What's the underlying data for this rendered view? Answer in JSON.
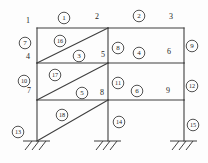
{
  "diagram": {
    "kind": "structural-frame-element-numbering",
    "background": "#fdfdfd",
    "line_color": "#3f3f3f",
    "text_color": "#1e1e1e",
    "circle_fill": "#fdfdfd",
    "nodes": [
      {
        "label": "1",
        "x": 28,
        "y": 21
      },
      {
        "label": "2",
        "x": 97,
        "y": 17
      },
      {
        "label": "3",
        "x": 171,
        "y": 17
      },
      {
        "label": "4",
        "x": 28,
        "y": 57
      },
      {
        "label": "5",
        "x": 103,
        "y": 55
      },
      {
        "label": "6",
        "x": 169,
        "y": 52
      },
      {
        "label": "7",
        "x": 29,
        "y": 91
      },
      {
        "label": "8",
        "x": 102,
        "y": 93
      },
      {
        "label": "9",
        "x": 168,
        "y": 91
      }
    ],
    "members": [
      {
        "id": "1",
        "type": "beam",
        "x1": 37,
        "y1": 28,
        "x2": 108,
        "y2": 28
      },
      {
        "id": "2",
        "type": "beam",
        "x1": 108,
        "y1": 28,
        "x2": 184,
        "y2": 28
      },
      {
        "id": "3",
        "type": "beam",
        "x1": 37,
        "y1": 63,
        "x2": 108,
        "y2": 63
      },
      {
        "id": "4",
        "type": "beam",
        "x1": 108,
        "y1": 63,
        "x2": 184,
        "y2": 63
      },
      {
        "id": "5",
        "type": "beam",
        "x1": 37,
        "y1": 100,
        "x2": 108,
        "y2": 100
      },
      {
        "id": "6",
        "type": "beam",
        "x1": 108,
        "y1": 100,
        "x2": 184,
        "y2": 100
      },
      {
        "id": "7",
        "type": "column",
        "x1": 37,
        "y1": 28,
        "x2": 37,
        "y2": 63
      },
      {
        "id": "8",
        "type": "column",
        "x1": 108,
        "y1": 28,
        "x2": 108,
        "y2": 63
      },
      {
        "id": "9",
        "type": "column",
        "x1": 184,
        "y1": 28,
        "x2": 184,
        "y2": 63
      },
      {
        "id": "10",
        "type": "column",
        "x1": 37,
        "y1": 63,
        "x2": 37,
        "y2": 100
      },
      {
        "id": "11",
        "type": "column",
        "x1": 108,
        "y1": 63,
        "x2": 108,
        "y2": 100
      },
      {
        "id": "12",
        "type": "column",
        "x1": 184,
        "y1": 63,
        "x2": 184,
        "y2": 100
      },
      {
        "id": "13",
        "type": "column",
        "x1": 37,
        "y1": 100,
        "x2": 37,
        "y2": 141
      },
      {
        "id": "14",
        "type": "column",
        "x1": 108,
        "y1": 100,
        "x2": 108,
        "y2": 141
      },
      {
        "id": "15",
        "type": "column",
        "x1": 184,
        "y1": 100,
        "x2": 184,
        "y2": 141
      },
      {
        "id": "16",
        "type": "diagonal",
        "x1": 37,
        "y1": 63,
        "x2": 108,
        "y2": 28
      },
      {
        "id": "17",
        "type": "diagonal",
        "x1": 37,
        "y1": 100,
        "x2": 108,
        "y2": 63
      },
      {
        "id": "18",
        "type": "diagonal",
        "x1": 37,
        "y1": 141,
        "x2": 108,
        "y2": 100
      }
    ],
    "element_labels": [
      {
        "label": "1",
        "x": 64,
        "y": 18
      },
      {
        "label": "2",
        "x": 139,
        "y": 16
      },
      {
        "label": "3",
        "x": 79,
        "y": 56
      },
      {
        "label": "4",
        "x": 139,
        "y": 53
      },
      {
        "label": "5",
        "x": 82,
        "y": 93
      },
      {
        "label": "6",
        "x": 137,
        "y": 91
      },
      {
        "label": "7",
        "x": 25,
        "y": 43
      },
      {
        "label": "8",
        "x": 118,
        "y": 48
      },
      {
        "label": "9",
        "x": 192,
        "y": 46
      },
      {
        "label": "10",
        "x": 24,
        "y": 81
      },
      {
        "label": "11",
        "x": 118,
        "y": 83
      },
      {
        "label": "12",
        "x": 192,
        "y": 86
      },
      {
        "label": "13",
        "x": 18,
        "y": 132
      },
      {
        "label": "14",
        "x": 119,
        "y": 122
      },
      {
        "label": "15",
        "x": 193,
        "y": 125
      },
      {
        "label": "16",
        "x": 60,
        "y": 41
      },
      {
        "label": "17",
        "x": 55,
        "y": 75
      },
      {
        "label": "18",
        "x": 62,
        "y": 115
      }
    ],
    "supports": [
      {
        "id": "left",
        "x": 37,
        "y": 141
      },
      {
        "id": "middle",
        "x": 108,
        "y": 141
      },
      {
        "id": "right",
        "x": 184,
        "y": 141
      }
    ]
  }
}
